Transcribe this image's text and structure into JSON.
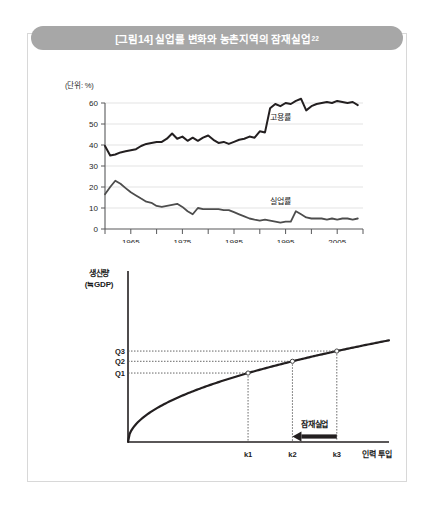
{
  "figure": {
    "title": "[그림14] 실업률 변화와 농촌지역의 잠재실업",
    "title_superscript": "22",
    "title_bar_color": "#a7a7a7",
    "frame_border_color": "#d8d8d8",
    "background": "#ffffff"
  },
  "chart_data": [
    {
      "type": "line",
      "id": "unemployment-employment-timeseries",
      "title": "",
      "unit_label": "(단위: %)",
      "xlabel": "",
      "ylabel": "",
      "ylim": [
        0,
        60
      ],
      "yticks": [
        0,
        10,
        20,
        30,
        40,
        50,
        60
      ],
      "ytick_labels": [
        "0",
        "10",
        "20",
        "30",
        "40",
        "50",
        "60"
      ],
      "xlim": [
        1960,
        2010
      ],
      "xticks": [
        1960,
        1965,
        1970,
        1975,
        1980,
        1985,
        1990,
        1995,
        2000,
        2005,
        2010
      ],
      "xtick_labels": [
        "",
        "1965",
        "",
        "1975",
        "",
        "1985",
        "",
        "1995",
        "",
        "2005",
        ""
      ],
      "grid": "horizontal",
      "legend_position": "inline-annotation",
      "line_color": "#231f20",
      "series": [
        {
          "name": "고용률",
          "label_x": 1994,
          "label_y": 52,
          "x": [
            1960,
            1961,
            1962,
            1963,
            1964,
            1965,
            1966,
            1967,
            1968,
            1969,
            1970,
            1971,
            1972,
            1973,
            1974,
            1975,
            1976,
            1977,
            1978,
            1979,
            1980,
            1981,
            1982,
            1983,
            1984,
            1985,
            1986,
            1987,
            1988,
            1989,
            1990,
            1991,
            1992,
            1993,
            1994,
            1995,
            1996,
            1997,
            1998,
            1999,
            2000,
            2001,
            2002,
            2003,
            2004,
            2005,
            2006,
            2007,
            2008,
            2009
          ],
          "values": [
            39.5,
            35.0,
            35.5,
            36.5,
            37.0,
            37.5,
            38.0,
            39.5,
            40.5,
            41.0,
            41.5,
            41.5,
            43.0,
            45.5,
            43.0,
            44.0,
            42.0,
            43.5,
            42.0,
            43.5,
            44.5,
            42.5,
            41.0,
            41.5,
            40.5,
            41.5,
            42.5,
            43.0,
            44.0,
            43.5,
            46.5,
            46.0,
            57.5,
            59.5,
            58.5,
            60.0,
            59.5,
            61.0,
            62.0,
            56.5,
            58.5,
            59.5,
            60.0,
            60.5,
            60.0,
            61.0,
            60.5,
            60.0,
            60.5,
            59.0
          ]
        },
        {
          "name": "실업률",
          "label_x": 1994,
          "label_y": 12,
          "x": [
            1960,
            1961,
            1962,
            1963,
            1964,
            1965,
            1966,
            1967,
            1968,
            1969,
            1970,
            1971,
            1972,
            1973,
            1974,
            1975,
            1976,
            1977,
            1978,
            1979,
            1980,
            1981,
            1982,
            1983,
            1984,
            1985,
            1986,
            1987,
            1988,
            1989,
            1990,
            1991,
            1992,
            1993,
            1994,
            1995,
            1996,
            1997,
            1998,
            1999,
            2000,
            2001,
            2002,
            2003,
            2004,
            2005,
            2006,
            2007,
            2008,
            2009
          ],
          "values": [
            16.5,
            20.0,
            23.0,
            21.5,
            19.5,
            17.5,
            16.0,
            14.5,
            13.0,
            12.5,
            11.0,
            10.5,
            11.0,
            11.5,
            12.0,
            10.5,
            8.5,
            7.0,
            10.0,
            9.5,
            9.5,
            9.5,
            9.5,
            9.0,
            9.0,
            8.0,
            7.0,
            6.0,
            5.0,
            4.5,
            4.0,
            4.5,
            4.0,
            3.5,
            3.0,
            3.5,
            3.5,
            8.5,
            7.0,
            5.5,
            5.0,
            5.0,
            5.0,
            4.5,
            5.0,
            4.5,
            5.0,
            5.0,
            4.5,
            5.0
          ]
        }
      ]
    },
    {
      "type": "line",
      "id": "production-function-curve",
      "title": "",
      "ylabel_line1": "생산량",
      "ylabel_line2": "(≒GDP)",
      "xlabel": "인력 투입",
      "grid": "none",
      "curve_description": "concave increasing production function",
      "y_markers": [
        {
          "label": "Q1",
          "y": 0.44
        },
        {
          "label": "Q2",
          "y": 0.5
        },
        {
          "label": "Q3",
          "y": 0.555
        }
      ],
      "x_markers": [
        {
          "label": "k1",
          "x": 0.46
        },
        {
          "label": "k2",
          "x": 0.63
        },
        {
          "label": "k3",
          "x": 0.8
        }
      ],
      "points": [
        {
          "x_label": "k1",
          "y_label": "Q1"
        },
        {
          "x_label": "k2",
          "y_label": "Q2"
        },
        {
          "x_label": "k3",
          "y_label": "Q3"
        }
      ],
      "annotation": {
        "label": "잠재실업",
        "arrow_from": "k3",
        "arrow_to": "k2",
        "direction": "left"
      }
    }
  ]
}
